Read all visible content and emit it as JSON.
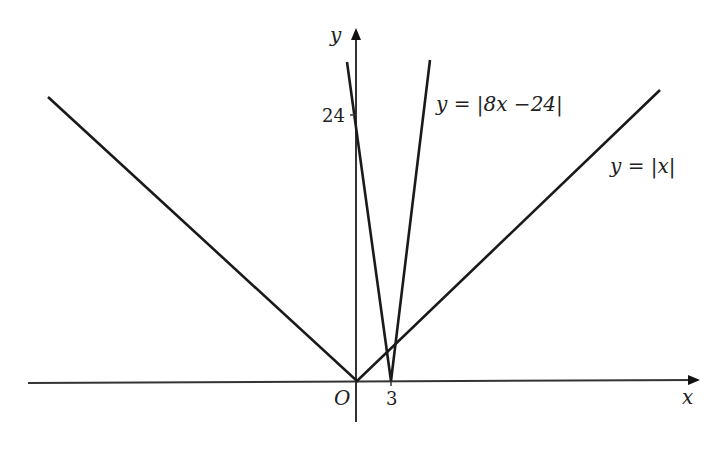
{
  "figure": {
    "axes": {
      "x_label": "x",
      "y_label": "y",
      "origin_label": "O",
      "x_tick": "3",
      "y_tick": "24"
    },
    "curves": [
      {
        "name": "abs-x",
        "label": "y = |x|",
        "expression": "y=|x|"
      },
      {
        "name": "abs-8x-minus-24",
        "label": "y = |8x −24|",
        "expression": "y=|8x-24|"
      }
    ],
    "colors": {
      "line": "#1a1a1a",
      "background": "#ffffff"
    }
  }
}
